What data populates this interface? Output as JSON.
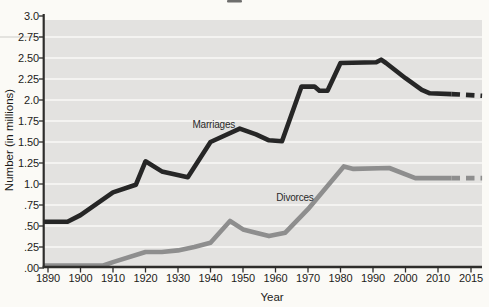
{
  "chart_data": {
    "type": "line",
    "title": "",
    "xlabel": "Year",
    "ylabel": "Number (in millions)",
    "x_tick_labels": [
      "1890",
      "1900",
      "1910",
      "1920",
      "1930",
      "1940",
      "1950",
      "1960",
      "1970",
      "1980",
      "1990",
      "2000",
      "2010",
      "2015"
    ],
    "x_tick_years": [
      1890,
      1900,
      1910,
      1920,
      1930,
      1940,
      1950,
      1960,
      1970,
      1980,
      1990,
      2000,
      2010,
      2015
    ],
    "y_tick_labels": [
      "3.0",
      "2.75",
      "2.50",
      "2.25",
      "2.0",
      "1.75",
      "1.50",
      "1.25",
      "1.0",
      ".75",
      ".50",
      ".25",
      ".00"
    ],
    "y_tick_values": [
      3.0,
      2.75,
      2.5,
      2.25,
      2.0,
      1.75,
      1.5,
      1.25,
      1.0,
      0.75,
      0.5,
      0.25,
      0.0
    ],
    "ylim": [
      0,
      3.0
    ],
    "xlim": [
      1890,
      2015
    ],
    "grid": {
      "horizontal": true,
      "interval": 0.25,
      "color": "#f4f3f1"
    },
    "legend": "inline labels next to lines",
    "series": [
      {
        "name": "Marriages",
        "color": "#262626",
        "style": "solid then dashed after ~2010",
        "label_at": {
          "year": 1941,
          "value": 1.72
        },
        "points": [
          [
            1890,
            0.55
          ],
          [
            1896,
            0.55
          ],
          [
            1900,
            0.63
          ],
          [
            1910,
            0.9
          ],
          [
            1917,
            0.99
          ],
          [
            1920,
            1.27
          ],
          [
            1925,
            1.15
          ],
          [
            1933,
            1.08
          ],
          [
            1940,
            1.5
          ],
          [
            1949,
            1.66
          ],
          [
            1954,
            1.59
          ],
          [
            1958,
            1.52
          ],
          [
            1962,
            1.51
          ],
          [
            1968,
            2.16
          ],
          [
            1972,
            2.16
          ],
          [
            1973.5,
            2.11
          ],
          [
            1976,
            2.11
          ],
          [
            1980,
            2.44
          ],
          [
            1991,
            2.45
          ],
          [
            1992.5,
            2.48
          ],
          [
            1994,
            2.44
          ],
          [
            2000,
            2.26
          ],
          [
            2005,
            2.12
          ],
          [
            2007.5,
            2.08
          ],
          [
            2012,
            2.07
          ]
        ],
        "projected_points": [
          [
            2012,
            2.07
          ],
          [
            2016.7,
            2.05
          ]
        ]
      },
      {
        "name": "Divorces",
        "color": "#8e8e8e",
        "style": "solid then dashed after ~2010",
        "label_at": {
          "year": 1966,
          "value": 0.84
        },
        "points": [
          [
            1890,
            0.03
          ],
          [
            1907,
            0.03
          ],
          [
            1910,
            0.07
          ],
          [
            1920,
            0.19
          ],
          [
            1925,
            0.19
          ],
          [
            1930,
            0.21
          ],
          [
            1935,
            0.25
          ],
          [
            1940,
            0.3
          ],
          [
            1946,
            0.56
          ],
          [
            1950,
            0.46
          ],
          [
            1953,
            0.43
          ],
          [
            1958,
            0.38
          ],
          [
            1963,
            0.42
          ],
          [
            1970,
            0.7
          ],
          [
            1981,
            1.21
          ],
          [
            1984,
            1.18
          ],
          [
            1995,
            1.19
          ],
          [
            2003,
            1.07
          ],
          [
            2012,
            1.07
          ]
        ],
        "projected_points": [
          [
            2012,
            1.07
          ],
          [
            2016.7,
            1.07
          ]
        ]
      }
    ],
    "colors": {
      "plot_background": "#e3e2e0",
      "gridline": "#f4f3f1",
      "axis": "#2e2d2b",
      "text": "#1d1c1a",
      "page_background": "#fbfaf6"
    }
  }
}
